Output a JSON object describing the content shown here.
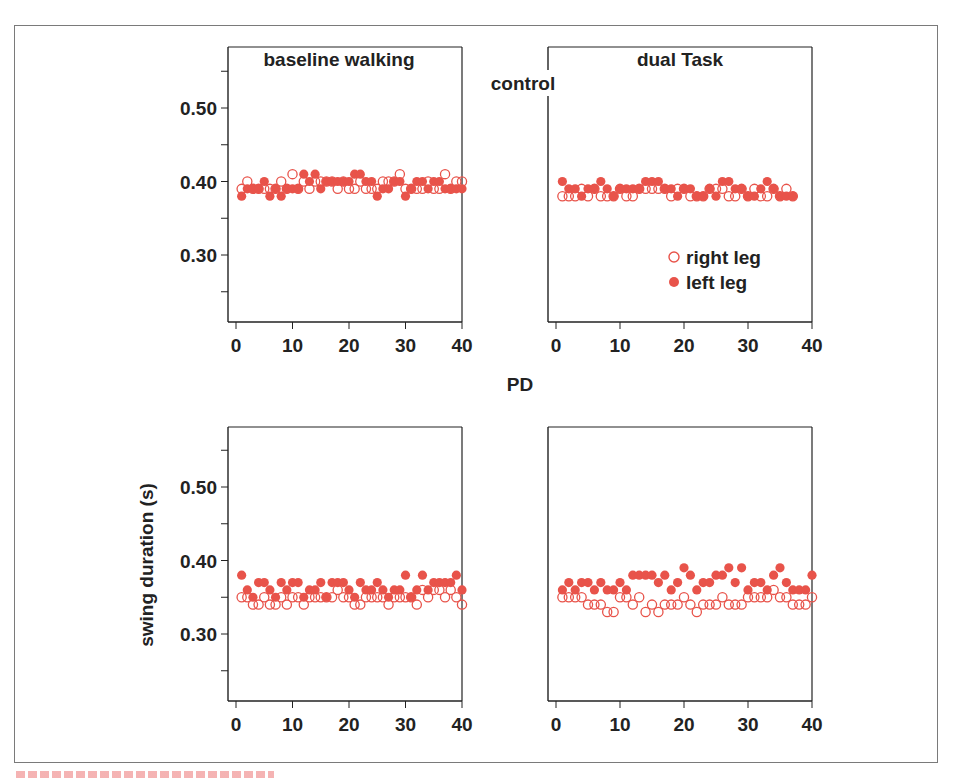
{
  "figure": {
    "group_labels": {
      "top": "control",
      "bottom": "PD"
    },
    "panel_titles": [
      "baseline walking",
      "dual Task"
    ],
    "ylabel": "swing duration (s)",
    "yticks": [
      "0.50",
      "0.40",
      "0.30"
    ],
    "xticks": [
      "0",
      "10",
      "20",
      "30",
      "40"
    ],
    "legend": {
      "open": "right leg",
      "filled": "left leg"
    },
    "colors": {
      "marker": "#e8534a",
      "axis": "#222222",
      "frame": "#7a7a7a"
    }
  },
  "chart_data": [
    {
      "type": "scatter",
      "title": "control — baseline walking",
      "xlabel": "",
      "ylabel": "",
      "xlim": [
        0,
        40
      ],
      "ylim": [
        0.22,
        0.57
      ],
      "grid": false,
      "series": [
        {
          "name": "right leg",
          "x": [
            1,
            2,
            3,
            4,
            5,
            6,
            7,
            8,
            9,
            10,
            11,
            12,
            13,
            14,
            15,
            16,
            17,
            18,
            19,
            20,
            21,
            22,
            23,
            24,
            25,
            26,
            27,
            28,
            29,
            30,
            31,
            32,
            33,
            34,
            35,
            36,
            37,
            38,
            39,
            40
          ],
          "y": [
            0.39,
            0.4,
            0.39,
            0.39,
            0.39,
            0.39,
            0.39,
            0.4,
            0.39,
            0.41,
            0.39,
            0.4,
            0.39,
            0.4,
            0.4,
            0.4,
            0.4,
            0.39,
            0.4,
            0.39,
            0.39,
            0.4,
            0.39,
            0.39,
            0.39,
            0.4,
            0.4,
            0.4,
            0.41,
            0.39,
            0.39,
            0.39,
            0.39,
            0.4,
            0.39,
            0.39,
            0.41,
            0.39,
            0.4,
            0.4
          ]
        },
        {
          "name": "left leg",
          "x": [
            1,
            2,
            3,
            4,
            5,
            6,
            7,
            8,
            9,
            10,
            11,
            12,
            13,
            14,
            15,
            16,
            17,
            18,
            19,
            20,
            21,
            22,
            23,
            24,
            25,
            26,
            27,
            28,
            29,
            30,
            31,
            32,
            33,
            34,
            35,
            36,
            37,
            38,
            39,
            40
          ],
          "y": [
            0.38,
            0.39,
            0.39,
            0.39,
            0.4,
            0.38,
            0.39,
            0.38,
            0.39,
            0.39,
            0.39,
            0.41,
            0.4,
            0.41,
            0.39,
            0.4,
            0.4,
            0.4,
            0.4,
            0.4,
            0.41,
            0.41,
            0.4,
            0.4,
            0.38,
            0.39,
            0.39,
            0.4,
            0.4,
            0.38,
            0.39,
            0.4,
            0.4,
            0.39,
            0.4,
            0.4,
            0.39,
            0.39,
            0.39,
            0.39
          ]
        }
      ]
    },
    {
      "type": "scatter",
      "title": "control — dual Task",
      "xlabel": "",
      "ylabel": "",
      "xlim": [
        0,
        40
      ],
      "ylim": [
        0.22,
        0.57
      ],
      "grid": false,
      "series": [
        {
          "name": "right leg",
          "x": [
            1,
            2,
            3,
            4,
            5,
            6,
            7,
            8,
            9,
            10,
            11,
            12,
            13,
            14,
            15,
            16,
            17,
            18,
            19,
            20,
            21,
            22,
            23,
            24,
            25,
            26,
            27,
            28,
            29,
            30,
            31,
            32,
            33,
            34,
            35,
            36,
            37
          ],
          "y": [
            0.38,
            0.38,
            0.38,
            0.39,
            0.38,
            0.39,
            0.38,
            0.38,
            0.38,
            0.39,
            0.38,
            0.38,
            0.39,
            0.39,
            0.39,
            0.39,
            0.39,
            0.38,
            0.39,
            0.39,
            0.38,
            0.38,
            0.38,
            0.39,
            0.39,
            0.39,
            0.38,
            0.38,
            0.39,
            0.38,
            0.39,
            0.38,
            0.38,
            0.39,
            0.38,
            0.39,
            0.38
          ]
        },
        {
          "name": "left leg",
          "x": [
            1,
            2,
            3,
            4,
            5,
            6,
            7,
            8,
            9,
            10,
            11,
            12,
            13,
            14,
            15,
            16,
            17,
            18,
            19,
            20,
            21,
            22,
            23,
            24,
            25,
            26,
            27,
            28,
            29,
            30,
            31,
            32,
            33,
            34,
            35,
            36,
            37
          ],
          "y": [
            0.4,
            0.39,
            0.39,
            0.38,
            0.39,
            0.39,
            0.4,
            0.39,
            0.38,
            0.39,
            0.39,
            0.39,
            0.39,
            0.4,
            0.4,
            0.4,
            0.39,
            0.39,
            0.38,
            0.39,
            0.39,
            0.38,
            0.38,
            0.39,
            0.38,
            0.4,
            0.4,
            0.39,
            0.39,
            0.38,
            0.38,
            0.39,
            0.4,
            0.39,
            0.38,
            0.38,
            0.38
          ]
        }
      ]
    },
    {
      "type": "scatter",
      "title": "PD — baseline walking",
      "xlabel": "",
      "ylabel": "swing duration (s)",
      "xlim": [
        0,
        40
      ],
      "ylim": [
        0.22,
        0.57
      ],
      "grid": false,
      "series": [
        {
          "name": "right leg",
          "x": [
            1,
            2,
            3,
            4,
            5,
            6,
            7,
            8,
            9,
            10,
            11,
            12,
            13,
            14,
            15,
            16,
            17,
            18,
            19,
            20,
            21,
            22,
            23,
            24,
            25,
            26,
            27,
            28,
            29,
            30,
            31,
            32,
            33,
            34,
            35,
            36,
            37,
            38,
            39,
            40
          ],
          "y": [
            0.35,
            0.35,
            0.34,
            0.34,
            0.35,
            0.34,
            0.34,
            0.35,
            0.34,
            0.35,
            0.35,
            0.34,
            0.35,
            0.35,
            0.35,
            0.35,
            0.35,
            0.36,
            0.35,
            0.35,
            0.34,
            0.34,
            0.35,
            0.35,
            0.35,
            0.35,
            0.34,
            0.35,
            0.35,
            0.35,
            0.35,
            0.34,
            0.36,
            0.35,
            0.36,
            0.36,
            0.35,
            0.36,
            0.35,
            0.34
          ]
        },
        {
          "name": "left leg",
          "x": [
            1,
            2,
            3,
            4,
            5,
            6,
            7,
            8,
            9,
            10,
            11,
            12,
            13,
            14,
            15,
            16,
            17,
            18,
            19,
            20,
            21,
            22,
            23,
            24,
            25,
            26,
            27,
            28,
            29,
            30,
            31,
            32,
            33,
            34,
            35,
            36,
            37,
            38,
            39,
            40
          ],
          "y": [
            0.38,
            0.36,
            0.35,
            0.37,
            0.37,
            0.36,
            0.35,
            0.37,
            0.36,
            0.37,
            0.37,
            0.35,
            0.36,
            0.36,
            0.37,
            0.35,
            0.37,
            0.37,
            0.37,
            0.36,
            0.35,
            0.37,
            0.36,
            0.36,
            0.37,
            0.36,
            0.35,
            0.36,
            0.36,
            0.38,
            0.35,
            0.36,
            0.38,
            0.36,
            0.37,
            0.37,
            0.37,
            0.37,
            0.38,
            0.36
          ]
        }
      ]
    },
    {
      "type": "scatter",
      "title": "PD — dual Task",
      "xlabel": "",
      "ylabel": "",
      "xlim": [
        0,
        40
      ],
      "ylim": [
        0.22,
        0.57
      ],
      "grid": false,
      "series": [
        {
          "name": "right leg",
          "x": [
            1,
            2,
            3,
            4,
            5,
            6,
            7,
            8,
            9,
            10,
            11,
            12,
            13,
            14,
            15,
            16,
            17,
            18,
            19,
            20,
            21,
            22,
            23,
            24,
            25,
            26,
            27,
            28,
            29,
            30,
            31,
            32,
            33,
            34,
            35,
            36,
            37,
            38,
            39,
            40
          ],
          "y": [
            0.35,
            0.35,
            0.35,
            0.35,
            0.34,
            0.34,
            0.34,
            0.33,
            0.33,
            0.35,
            0.35,
            0.34,
            0.35,
            0.33,
            0.34,
            0.33,
            0.34,
            0.34,
            0.34,
            0.35,
            0.34,
            0.33,
            0.34,
            0.34,
            0.34,
            0.35,
            0.34,
            0.34,
            0.34,
            0.35,
            0.35,
            0.35,
            0.35,
            0.36,
            0.35,
            0.35,
            0.34,
            0.34,
            0.34,
            0.35
          ]
        },
        {
          "name": "left leg",
          "x": [
            1,
            2,
            3,
            4,
            5,
            6,
            7,
            8,
            9,
            10,
            11,
            12,
            13,
            14,
            15,
            16,
            17,
            18,
            19,
            20,
            21,
            22,
            23,
            24,
            25,
            26,
            27,
            28,
            29,
            30,
            31,
            32,
            33,
            34,
            35,
            36,
            37,
            38,
            39,
            40
          ],
          "y": [
            0.36,
            0.37,
            0.36,
            0.37,
            0.37,
            0.36,
            0.37,
            0.36,
            0.36,
            0.37,
            0.36,
            0.38,
            0.38,
            0.38,
            0.38,
            0.37,
            0.38,
            0.36,
            0.37,
            0.39,
            0.38,
            0.36,
            0.37,
            0.37,
            0.38,
            0.38,
            0.39,
            0.37,
            0.39,
            0.36,
            0.37,
            0.37,
            0.36,
            0.38,
            0.39,
            0.37,
            0.36,
            0.36,
            0.36,
            0.38
          ]
        }
      ]
    }
  ]
}
